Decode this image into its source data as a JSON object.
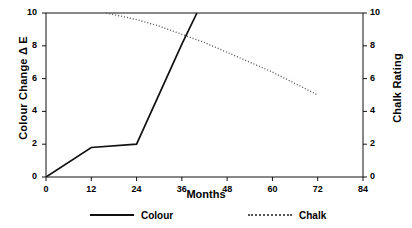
{
  "chart_data": {
    "type": "line",
    "title": "",
    "xlabel": "Months",
    "ylabel": "Colour Change Δ E",
    "y2label": "Chalk Rating",
    "xlim": [
      0,
      84
    ],
    "ylim": [
      0,
      10
    ],
    "y2lim": [
      0,
      10
    ],
    "xticks": [
      "0",
      "12",
      "24",
      "36",
      "48",
      "60",
      "72",
      "84"
    ],
    "yticks": [
      "0",
      "2",
      "4",
      "6",
      "8",
      "10"
    ],
    "y2ticks": [
      "0",
      "2",
      "4",
      "6",
      "8",
      "10"
    ],
    "grid": false,
    "legend_position": "below-axes",
    "series": [
      {
        "name": "Colour",
        "axis": "left",
        "style": "solid",
        "color": "#111111",
        "x": [
          0,
          12,
          24,
          36,
          40
        ],
        "values": [
          0,
          1.8,
          2.0,
          8.1,
          10.0
        ]
      },
      {
        "name": "Chalk",
        "axis": "right",
        "style": "dotted",
        "color": "#555555",
        "x": [
          16,
          24,
          30,
          36,
          42,
          48,
          54,
          60,
          66,
          72
        ],
        "values": [
          10.0,
          9.6,
          9.2,
          8.7,
          8.2,
          7.6,
          7.0,
          6.4,
          5.7,
          5.0
        ]
      }
    ]
  },
  "axes": {
    "x_title": "Months",
    "y_left_title": "Colour Change Δ E",
    "y_right_title": "Chalk Rating"
  },
  "legend": {
    "items": [
      {
        "label": "Colour",
        "style": "solid"
      },
      {
        "label": "Chalk",
        "style": "dotted"
      }
    ]
  }
}
